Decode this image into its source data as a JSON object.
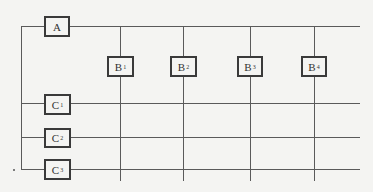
{
  "diagram": {
    "type": "network-grid",
    "top_node": {
      "label": "A",
      "subscript": ""
    },
    "column_nodes": [
      {
        "label": "B",
        "subscript": "1"
      },
      {
        "label": "B",
        "subscript": "2"
      },
      {
        "label": "B",
        "subscript": "3"
      },
      {
        "label": "B",
        "subscript": "4"
      }
    ],
    "row_nodes": [
      {
        "label": "C",
        "subscript": "1"
      },
      {
        "label": "C",
        "subscript": "2"
      },
      {
        "label": "C",
        "subscript": "3"
      }
    ],
    "colors": {
      "line": "#5a5a5a",
      "box_border": "#3a3a3a",
      "background": "#f4f4f2"
    }
  }
}
